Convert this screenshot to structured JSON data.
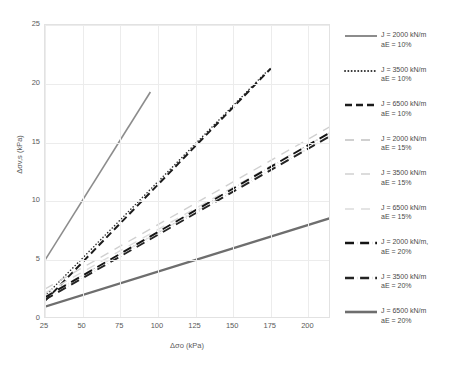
{
  "chart_data": {
    "type": "line",
    "title": "",
    "xlabel": "Δσo (kPa)",
    "ylabel": "Δσv,s (kPa)",
    "xlim": [
      25,
      215
    ],
    "ylim": [
      0,
      25
    ],
    "xticks": [
      25,
      50,
      75,
      100,
      125,
      150,
      175,
      200
    ],
    "yticks": [
      0,
      5,
      10,
      15,
      20,
      25
    ],
    "grid": true,
    "legend_position": "right",
    "series": [
      {
        "name": "J = 2000 kN/m\naE = 10%",
        "J": 2000,
        "aE": "10%",
        "style": "solid",
        "color": "#8c8c8c",
        "width": 1.6,
        "x": [
          25,
          95
        ],
        "y": [
          5.0,
          19.3
        ]
      },
      {
        "name": "J = 3500 kN/m\naE = 10%",
        "J": 3500,
        "aE": "10%",
        "style": "dotted",
        "color": "#303030",
        "width": 1.5,
        "x": [
          25,
          172
        ],
        "y": [
          1.95,
          21.0
        ]
      },
      {
        "name": "J = 6500 kN/m\naE = 10%",
        "J": 6500,
        "aE": "10%",
        "style": "dashed",
        "color": "#1c1c1c",
        "width": 2.0,
        "x": [
          25,
          175
        ],
        "y": [
          1.55,
          21.3
        ]
      },
      {
        "name": "J = 2000 kN/m\naE = 15%",
        "J": 2000,
        "aE": "15%",
        "style": "longdash",
        "color": "#d0d0d0",
        "width": 1.4,
        "x": [
          25,
          215
        ],
        "y": [
          2.55,
          16.4
        ]
      },
      {
        "name": "J = 3500 kN/m\naE = 15%",
        "J": 3500,
        "aE": "15%",
        "style": "longdash",
        "color": "#dcdcdc",
        "width": 1.4,
        "x": [
          25,
          215
        ],
        "y": [
          2.2,
          15.9
        ]
      },
      {
        "name": "J = 6500 kN/m\naE = 15%",
        "J": 6500,
        "aE": "15%",
        "style": "longdash",
        "color": "#e4e4e4",
        "width": 1.4,
        "x": [
          25,
          215
        ],
        "y": [
          1.95,
          15.6
        ]
      },
      {
        "name": "J = 2000 kN/m,\naE = 20%",
        "J": 2000,
        "aE": "20%",
        "style": "dashdot",
        "color": "#141414",
        "width": 1.9,
        "x": [
          25,
          215
        ],
        "y": [
          1.85,
          15.9
        ]
      },
      {
        "name": "J = 3500 kN/m\naE = 20%",
        "J": 3500,
        "aE": "20%",
        "style": "dashdot",
        "color": "#242424",
        "width": 1.9,
        "x": [
          25,
          215
        ],
        "y": [
          1.65,
          15.6
        ]
      },
      {
        "name": "J = 6500 kN/m\naE = 20%",
        "J": 6500,
        "aE": "20%",
        "style": "solid",
        "color": "#6e6e6e",
        "width": 2.2,
        "x": [
          25,
          215
        ],
        "y": [
          1.05,
          8.6
        ]
      }
    ]
  },
  "axes": {
    "x": {
      "label": "Δσo (kPa)",
      "ticks": [
        "25",
        "50",
        "75",
        "100",
        "125",
        "150",
        "175",
        "200"
      ]
    },
    "y": {
      "label": "Δσv,s (kPa)",
      "ticks": [
        "0",
        "5",
        "10",
        "15",
        "20",
        "25"
      ]
    }
  },
  "legend": {
    "items": [
      {
        "label": "J = 2000 kN/m\naE = 10%",
        "swatch": "line-solid-gray"
      },
      {
        "label": "J = 3500 kN/m\naE = 10%",
        "swatch": "line-dotted-dark"
      },
      {
        "label": "J = 6500 kN/m\naE = 10%",
        "swatch": "line-dashed-dark"
      },
      {
        "label": "J = 2000 kN/m\naE = 15%",
        "swatch": "line-longdash-light"
      },
      {
        "label": "J = 3500 kN/m\naE = 15%",
        "swatch": "line-longdash-lighter"
      },
      {
        "label": "J = 6500 kN/m\naE = 15%",
        "swatch": "line-longdash-lightest"
      },
      {
        "label": "J = 2000 kN/m,\naE = 20%",
        "swatch": "line-dashdot-black"
      },
      {
        "label": "J = 3500 kN/m\naE = 20%",
        "swatch": "line-dashdot-black"
      },
      {
        "label": "J = 6500 kN/m\naE = 20%",
        "swatch": "line-solid-thick-gray"
      }
    ]
  }
}
